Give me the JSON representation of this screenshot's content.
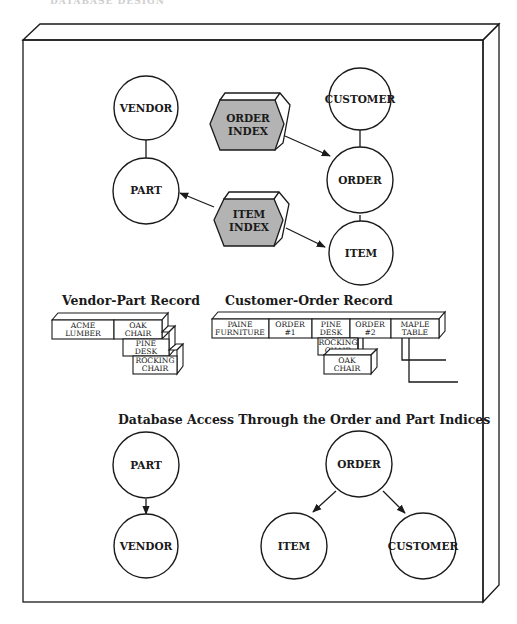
{
  "page_header": "DATABASE DESIGN",
  "colors": {
    "ink": "#1a1a1a",
    "index_fill": "#b3b3b3",
    "index_side": "#ffffff",
    "paper": "#ffffff"
  },
  "top_diagram": {
    "nodes": {
      "vendor": "VENDOR",
      "part": "PART",
      "customer": "CUSTOMER",
      "order": "ORDER",
      "item": "ITEM"
    },
    "indices": {
      "order_index": {
        "line1": "ORDER",
        "line2": "INDEX"
      },
      "item_index": {
        "line1": "ITEM",
        "line2": "INDEX"
      }
    }
  },
  "vendor_part_record": {
    "title": "Vendor-Part Record",
    "cells": [
      {
        "line1": "ACME",
        "line2": "LUMBER"
      },
      {
        "line1": "OAK",
        "line2": "CHAIR"
      },
      {
        "line1": "PINE",
        "line2": "DESK"
      },
      {
        "line1": "ROCKING",
        "line2": "CHAIR"
      }
    ]
  },
  "customer_order_record": {
    "title": "Customer-Order Record",
    "cells": [
      {
        "line1": "PAINE",
        "line2": "FURNITURE"
      },
      {
        "line1": "ORDER",
        "line2": "#1"
      },
      {
        "line1": "PINE",
        "line2": "DESK"
      },
      {
        "line1": "ORDER",
        "line2": "#2"
      },
      {
        "line1": "MAPLE",
        "line2": "TABLE"
      }
    ],
    "sub_cells": [
      {
        "line1": "ROCKING",
        "line2": "CHAIR"
      },
      {
        "line1": "OAK",
        "line2": "CHAIR"
      }
    ]
  },
  "bottom_diagram": {
    "title": "Database Access Through the Order and Part Indices",
    "nodes": {
      "part": "PART",
      "vendor": "VENDOR",
      "order": "ORDER",
      "item": "ITEM",
      "customer": "CUSTOMER"
    }
  }
}
